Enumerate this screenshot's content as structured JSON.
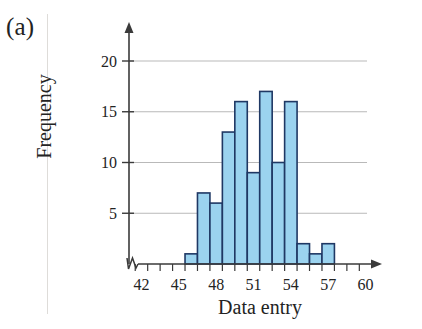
{
  "figure": {
    "panel_label": "(a)",
    "background_color": "#ffffff"
  },
  "axes": {
    "y_title": "Frequency",
    "x_title": "Data entry",
    "axis_color": "#3a3a3a",
    "grid_color": "#b9b9b9",
    "y_ticks": [
      5,
      10,
      15,
      20
    ],
    "y_tick_labels": [
      "5",
      "10",
      "15",
      "20"
    ],
    "x_tick_labels": [
      "42",
      "45",
      "48",
      "51",
      "54",
      "57",
      "60"
    ],
    "x_break_symbol": "axis-break-zigzag"
  },
  "chart_data": {
    "type": "bar",
    "title": "",
    "xlabel": "Data entry",
    "ylabel": "Frequency",
    "xlim": [
      40.5,
      60.5
    ],
    "ylim": [
      0,
      21.5
    ],
    "grid": true,
    "legend": "none",
    "bar_fill_color": "#9BD3EF",
    "bar_edge_color": "#1F3864",
    "bin_width": 1,
    "bin_starts": [
      45.5,
      46.5,
      47.5,
      48.5,
      49.5,
      50.5,
      51.5,
      52.5,
      53.5,
      54.5,
      55.5,
      56.5
    ],
    "bin_midpoints": [
      46,
      47,
      48,
      49,
      50,
      51,
      52,
      53,
      54,
      55,
      56,
      57
    ],
    "categories": [
      "46",
      "47",
      "48",
      "49",
      "50",
      "51",
      "52",
      "53",
      "54",
      "55",
      "56",
      "57"
    ],
    "values": [
      1,
      7,
      6,
      13,
      16,
      9,
      17,
      10,
      16,
      2,
      1,
      2
    ],
    "y_major_ticks": [
      5,
      10,
      15,
      20
    ],
    "x_major_ticks": [
      42,
      45,
      48,
      51,
      54,
      57,
      60
    ],
    "x_minor_tick_step": 1
  }
}
